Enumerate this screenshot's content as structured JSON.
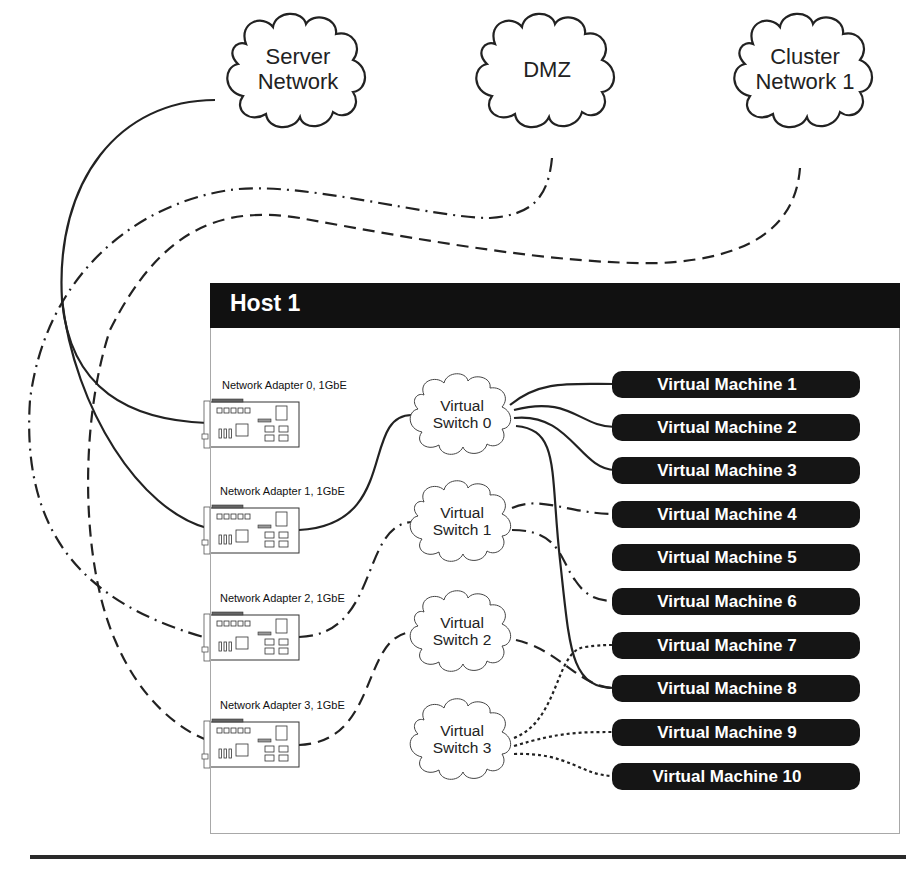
{
  "networks": [
    {
      "id": "server",
      "label_lines": [
        "Server",
        "Network"
      ],
      "line_style": "solid"
    },
    {
      "id": "dmz",
      "label_lines": [
        "DMZ"
      ],
      "line_style": "dash-dot"
    },
    {
      "id": "cluster1",
      "label_lines": [
        "Cluster",
        "Network 1"
      ],
      "line_style": "dashed"
    }
  ],
  "host": {
    "title": "Host 1",
    "header_color": "#111111",
    "border_color": "#a8a8a8"
  },
  "adapters": [
    {
      "label": "Network Adapter 0, 1GbE"
    },
    {
      "label": "Network Adapter 1, 1GbE"
    },
    {
      "label": "Network Adapter 2, 1GbE"
    },
    {
      "label": "Network Adapter 3, 1GbE"
    }
  ],
  "switches": [
    {
      "label_lines": [
        "Virtual",
        "Switch 0"
      ],
      "line_style": "solid"
    },
    {
      "label_lines": [
        "Virtual",
        "Switch 1"
      ],
      "line_style": "dash-dot"
    },
    {
      "label_lines": [
        "Virtual",
        "Switch 2"
      ],
      "line_style": "dashed"
    },
    {
      "label_lines": [
        "Virtual",
        "Switch 3"
      ],
      "line_style": "dotted"
    }
  ],
  "vms": [
    {
      "label": "Virtual Machine 1",
      "switch": 0
    },
    {
      "label": "Virtual Machine 2",
      "switch": 0
    },
    {
      "label": "Virtual Machine 3",
      "switch": 0
    },
    {
      "label": "Virtual Machine 4",
      "switch": 1
    },
    {
      "label": "Virtual Machine 5",
      "switch": null
    },
    {
      "label": "Virtual Machine 6",
      "switch": 1
    },
    {
      "label": "Virtual Machine 7",
      "switch": 3
    },
    {
      "label": "Virtual Machine 8",
      "switch": "0,2"
    },
    {
      "label": "Virtual Machine 9",
      "switch": 3
    },
    {
      "label": "Virtual Machine 10",
      "switch": 3
    }
  ],
  "connections": {
    "server_network": [
      "Network Adapter 0",
      "Network Adapter 1"
    ],
    "dmz": [
      "Network Adapter 2"
    ],
    "cluster_network_1": [
      "Network Adapter 3"
    ],
    "adapter_to_switch": {
      "Network Adapter 1": "Virtual Switch 0",
      "Network Adapter 2": "Virtual Switch 1",
      "Network Adapter 3": "Virtual Switch 2"
    }
  },
  "colors": {
    "line": "#222222",
    "vm_fill": "#151515",
    "vm_text": "#ffffff",
    "rule": "#2a2a2a"
  }
}
